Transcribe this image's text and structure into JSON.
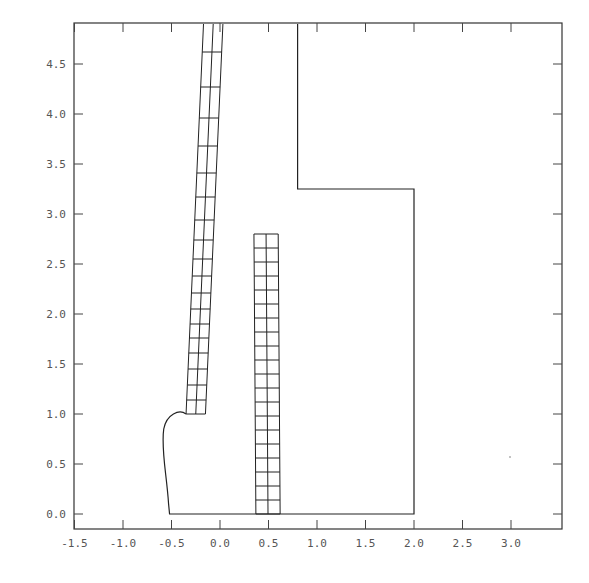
{
  "chart_data": {
    "type": "line",
    "title": "",
    "xlabel": "",
    "ylabel": "",
    "xlim": [
      -1.55,
      3.5
    ],
    "ylim": [
      -0.15,
      4.9
    ],
    "grid": false,
    "legend": null,
    "x_ticks": [
      -1.5,
      -1.0,
      -0.5,
      0.0,
      0.5,
      1.0,
      1.5,
      2.0,
      2.5,
      3.0
    ],
    "x_tick_labels": [
      "-1.5",
      "-1.0",
      "-0.5",
      "0.0",
      "0.5",
      "1.0",
      "1.5",
      "2.0",
      "2.5",
      "3.0"
    ],
    "y_ticks": [
      0.0,
      0.5,
      1.0,
      1.5,
      2.0,
      2.5,
      3.0,
      3.5,
      4.0,
      4.5
    ],
    "y_tick_labels": [
      "0.0",
      "0.5",
      "1.0",
      "1.5",
      "2.0",
      "2.5",
      "3.0",
      "3.5",
      "4.0",
      "4.5"
    ],
    "series": [
      {
        "name": "domain-boundary",
        "kind": "polyline",
        "points": [
          [
            -0.35,
            1.0
          ],
          [
            -0.48,
            1.02
          ],
          [
            -0.58,
            0.85
          ],
          [
            -0.57,
            0.55
          ],
          [
            -0.53,
            0.1
          ],
          [
            -0.52,
            0.0
          ],
          [
            2.0,
            0.0
          ],
          [
            2.0,
            3.25
          ],
          [
            0.8,
            3.25
          ],
          [
            0.8,
            4.9
          ]
        ]
      },
      {
        "name": "left-inclined-mesh",
        "kind": "mesh",
        "columns": 2,
        "bottom": {
          "y": 1.0,
          "x_left": -0.35,
          "x_right": -0.15
        },
        "top": {
          "y": 4.9,
          "x_left": -0.17,
          "x_right": 0.03
        },
        "row_y": [
          4.62,
          4.27,
          3.96,
          3.68,
          3.41,
          3.17,
          2.94,
          2.74,
          2.55,
          2.38,
          2.21,
          2.05,
          1.9,
          1.76,
          1.61,
          1.45,
          1.29,
          1.14,
          1.0
        ]
      },
      {
        "name": "right-vertical-mesh",
        "kind": "mesh",
        "columns": 2,
        "bottom": {
          "y": 0.0,
          "x_left": 0.37,
          "x_right": 0.62
        },
        "top": {
          "y": 2.8,
          "x_left": 0.35,
          "x_right": 0.6
        },
        "rows": 20
      }
    ]
  },
  "plot": {
    "frame_px": {
      "left": 74,
      "top": 23,
      "right": 562,
      "bottom": 529
    },
    "x_px_per_unit": 97,
    "x_origin_px": 220,
    "y_px_per_unit": 100,
    "y_origin_px": 514,
    "line_color": "#222222",
    "label_color": "#555555"
  }
}
